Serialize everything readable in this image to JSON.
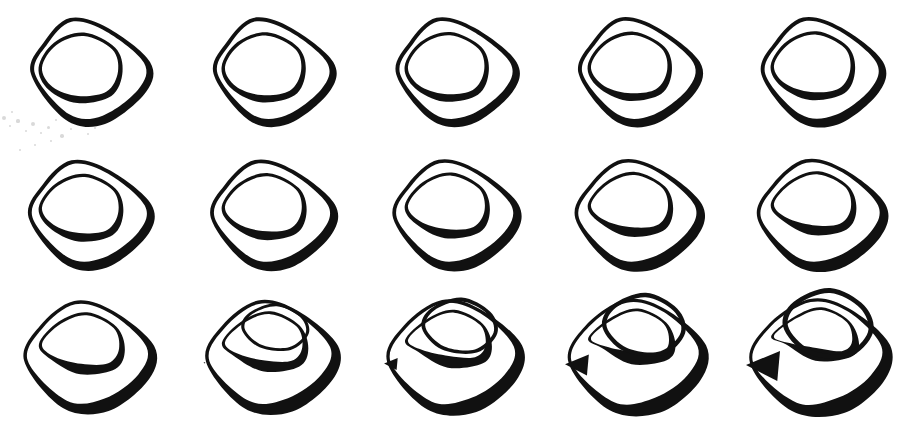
{
  "figure": {
    "background_color": "#ffffff",
    "stroke_color": "#111111",
    "canvas": {
      "width": 916,
      "height": 428
    },
    "grid": {
      "rows": 3,
      "columns": 5,
      "cell_width": 183,
      "cell_height": 143
    }
  },
  "cells": [
    {
      "id": "frame-1",
      "row": 1,
      "column": 1,
      "label": "frame 1",
      "stage": "undeformed rounded-triangle band",
      "deform": 0.0,
      "x": 0,
      "y": 0
    },
    {
      "id": "frame-2",
      "row": 1,
      "column": 2,
      "label": "frame 2",
      "stage": "undeformed rounded-triangle band",
      "deform": 0.03,
      "x": 183,
      "y": 0
    },
    {
      "id": "frame-3",
      "row": 1,
      "column": 3,
      "label": "frame 3",
      "stage": "undeformed rounded-triangle band",
      "deform": 0.06,
      "x": 366,
      "y": 0
    },
    {
      "id": "frame-4",
      "row": 1,
      "column": 4,
      "label": "frame 4",
      "stage": "undeformed rounded-triangle band",
      "deform": 0.09,
      "x": 549,
      "y": 0
    },
    {
      "id": "frame-5",
      "row": 1,
      "column": 5,
      "label": "frame 5",
      "stage": "undeformed rounded-triangle band",
      "deform": 0.12,
      "x": 732,
      "y": 0
    },
    {
      "id": "frame-6",
      "row": 2,
      "column": 1,
      "label": "frame 6",
      "stage": "slight inward pinch begins",
      "deform": 0.18,
      "x": 0,
      "y": 143
    },
    {
      "id": "frame-7",
      "row": 2,
      "column": 2,
      "label": "frame 7",
      "stage": "slight inward pinch begins",
      "deform": 0.24,
      "x": 183,
      "y": 143
    },
    {
      "id": "frame-8",
      "row": 2,
      "column": 3,
      "label": "frame 8",
      "stage": "inner hole drifts upward",
      "deform": 0.3,
      "x": 366,
      "y": 143
    },
    {
      "id": "frame-9",
      "row": 2,
      "column": 4,
      "label": "frame 9",
      "stage": "inner hole drifts upward",
      "deform": 0.36,
      "x": 549,
      "y": 143
    },
    {
      "id": "frame-10",
      "row": 2,
      "column": 5,
      "label": "frame 10",
      "stage": "inner hole drifts upward",
      "deform": 0.42,
      "x": 732,
      "y": 143
    },
    {
      "id": "frame-11",
      "row": 3,
      "column": 1,
      "label": "frame 11",
      "stage": "band widens at lower right",
      "deform": 0.52,
      "x": 0,
      "y": 285
    },
    {
      "id": "frame-12",
      "row": 3,
      "column": 2,
      "label": "frame 12",
      "stage": "band widens at lower right",
      "deform": 0.62,
      "x": 183,
      "y": 285
    },
    {
      "id": "frame-13",
      "row": 3,
      "column": 3,
      "label": "frame 13",
      "stage": "left corner collapses to a cusp, ribbon thickens",
      "deform": 0.76,
      "x": 366,
      "y": 285
    },
    {
      "id": "frame-14",
      "row": 3,
      "column": 4,
      "label": "frame 14",
      "stage": "cusp sharpens, strong self-overlap",
      "deform": 0.88,
      "x": 549,
      "y": 285
    },
    {
      "id": "frame-15",
      "row": 3,
      "column": 5,
      "label": "frame 15",
      "stage": "fully pinched, broad dark ribbon with crossed lobes",
      "deform": 1.0,
      "x": 732,
      "y": 285
    }
  ],
  "artifacts": {
    "name": "scan-speckles",
    "note": "faint grey dust specks in the lower-left region of the first frame",
    "points": [
      {
        "x": 4,
        "y": 118,
        "r": 2.0
      },
      {
        "x": 10,
        "y": 126,
        "r": 1.3
      },
      {
        "x": 18,
        "y": 121,
        "r": 1.6
      },
      {
        "x": 26,
        "y": 131,
        "r": 1.1
      },
      {
        "x": 33,
        "y": 124,
        "r": 2.2
      },
      {
        "x": 41,
        "y": 133,
        "r": 1.2
      },
      {
        "x": 48,
        "y": 127,
        "r": 1.5
      },
      {
        "x": 56,
        "y": 120,
        "r": 1.0
      },
      {
        "x": 62,
        "y": 136,
        "r": 1.8
      },
      {
        "x": 71,
        "y": 129,
        "r": 1.1
      },
      {
        "x": 79,
        "y": 123,
        "r": 1.4
      },
      {
        "x": 88,
        "y": 134,
        "r": 1.0
      },
      {
        "x": 35,
        "y": 145,
        "r": 1.2
      },
      {
        "x": 51,
        "y": 141,
        "r": 0.9
      },
      {
        "x": 20,
        "y": 150,
        "r": 1.0
      },
      {
        "x": 67,
        "y": 117,
        "r": 0.9
      },
      {
        "x": 95,
        "y": 128,
        "r": 1.1
      },
      {
        "x": 12,
        "y": 112,
        "r": 1.0
      }
    ]
  }
}
